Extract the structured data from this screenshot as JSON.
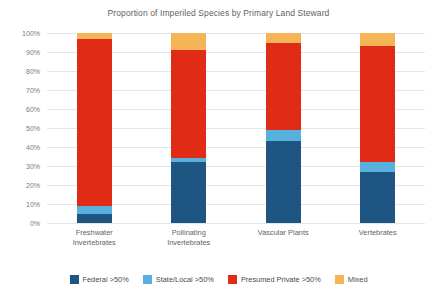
{
  "chart_data": {
    "type": "bar",
    "subtype": "stacked-percent-column",
    "title": "Proportion of Imperiled Species by Primary Land Steward",
    "xlabel": "",
    "ylabel": "",
    "ylim": [
      0,
      100
    ],
    "ytick_labels": [
      "0%",
      "10%",
      "20%",
      "30%",
      "40%",
      "50%",
      "60%",
      "70%",
      "80%",
      "90%",
      "100%"
    ],
    "ytick_values": [
      0,
      10,
      20,
      30,
      40,
      50,
      60,
      70,
      80,
      90,
      100
    ],
    "grid": true,
    "legend_position": "bottom",
    "categories": [
      "Freshwater Invertebrates",
      "Pollinating Invertebrates",
      "Vascular Plants",
      "Vertebrates"
    ],
    "category_lines": [
      [
        "Freshwater",
        "Invertebrates"
      ],
      [
        "Pollinating",
        "Invertebrates"
      ],
      [
        "Vascular Plants",
        ""
      ],
      [
        "Vertebrates",
        ""
      ]
    ],
    "series": [
      {
        "name": "Federal >50%",
        "color": "#1f5582",
        "values": [
          5,
          32,
          43,
          27
        ]
      },
      {
        "name": "State/Local >50%",
        "color": "#57b0dd",
        "values": [
          4,
          2,
          6,
          5
        ]
      },
      {
        "name": "Presumed Private >50%",
        "color": "#e02b17",
        "values": [
          88,
          57,
          46,
          61
        ]
      },
      {
        "name": "Mixed",
        "color": "#f5b456",
        "values": [
          3,
          9,
          5,
          7
        ]
      }
    ]
  },
  "colors": {
    "federal": "#1f5582",
    "state_local": "#57b0dd",
    "presumed_private": "#e02b17",
    "mixed": "#f5b456",
    "gridline": "#e3e6ea",
    "text": "#5f5f5f",
    "background": "#ffffff"
  }
}
